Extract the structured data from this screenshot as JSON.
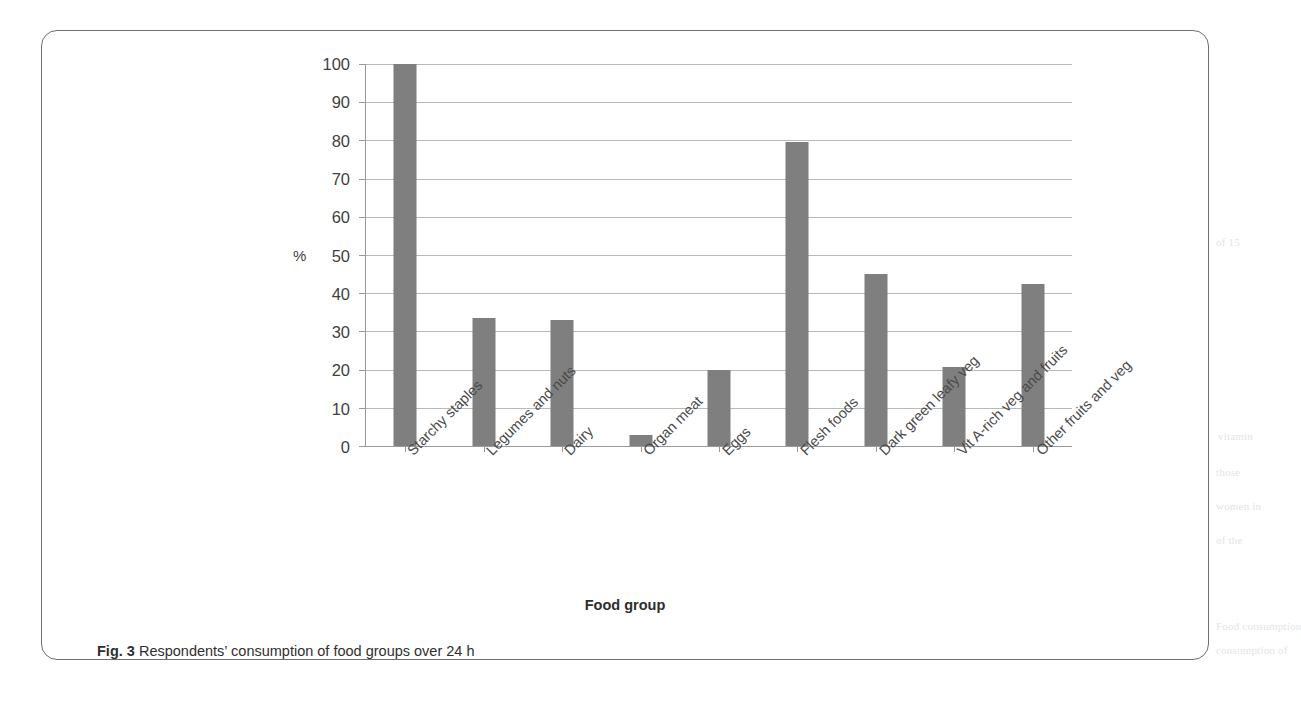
{
  "figure": {
    "caption_label": "Fig. 3",
    "caption_text": "Respondents’ consumption of food groups over 24 h"
  },
  "chart_data": {
    "type": "bar",
    "title": "",
    "xlabel": "Food group",
    "ylabel": "%",
    "ylim": [
      0,
      100
    ],
    "yticks": [
      0,
      10,
      20,
      30,
      40,
      50,
      60,
      70,
      80,
      90,
      100
    ],
    "grid": true,
    "legend": null,
    "bar_color": "#7f7f7f",
    "categories": [
      "Starchy staples",
      "Legumes and nuts",
      "Dairy",
      "Organ meat",
      "Eggs",
      "Flesh foods",
      "Dark green leafy veg",
      "Vit A-rich veg and fruits",
      "Other fruits and veg"
    ],
    "values": [
      100,
      33.5,
      33,
      3,
      19.8,
      79.5,
      45,
      20.8,
      42.3
    ]
  },
  "ghost_text": [
    "of 15",
    "vitamin",
    "those",
    "women in",
    "of the",
    "Food consumption",
    "consumption of"
  ]
}
